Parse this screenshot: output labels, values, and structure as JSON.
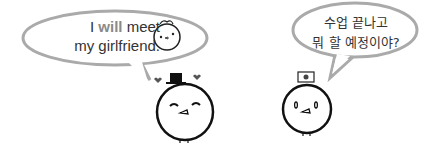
{
  "left_bubble": {
    "line1_pre": "I ",
    "line1_highlight": "will",
    "line1_post": " meet",
    "line2": "my girlfriend."
  },
  "right_bubble": {
    "line1": "수업 끝나고",
    "line2": "뭐 할 예정이야?"
  },
  "characters": [
    {
      "name": "boy-with-top-hat",
      "accessory": "top-hat"
    },
    {
      "name": "boy-with-korean-flag",
      "accessory": "korean-flag-hat"
    }
  ]
}
